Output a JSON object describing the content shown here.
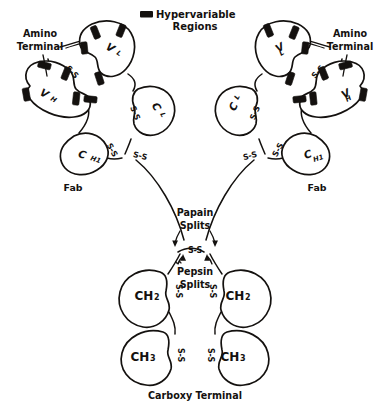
{
  "figure": {
    "background_color": "#ffffff",
    "ink_color": "#14110f",
    "width": 390,
    "height": 410
  },
  "legend": {
    "swatch_name": "hypervariable-region-swatch",
    "swatch_color": "#14110f",
    "line1": "Hypervariable",
    "line2": "Regions"
  },
  "annotations": {
    "amino_terminal_left_line1": "Amino",
    "amino_terminal_left_line2": "Terminal",
    "amino_terminal_right_line1": "Amino",
    "amino_terminal_right_line2": "Terminal",
    "papain_line1": "Papain",
    "papain_line2": "Splits",
    "pepsin_line1": "Pepsin",
    "pepsin_line2": "Splits",
    "carboxy_terminal": "Carboxy Terminal",
    "fab_left": "Fab",
    "fab_right": "Fab"
  },
  "domains": {
    "vl_left": "V",
    "vl_left_sub": "L",
    "vh_left": "V",
    "vh_left_sub": "H",
    "cl_left": "C",
    "cl_left_sub": "L",
    "ch1_left": "C",
    "ch1_left_sub": "H1",
    "vl_right": "V",
    "vl_right_sub": "L",
    "vh_right": "V",
    "vh_right_sub": "H",
    "cl_right": "C",
    "cl_right_sub": "L",
    "ch1_right": "C",
    "ch1_right_sub": "H1",
    "ch2_left": "CH",
    "ch2_left_sub": "2",
    "ch2_right": "CH",
    "ch2_right_sub": "2",
    "ch3_left": "CH",
    "ch3_left_sub": "3",
    "ch3_right": "CH",
    "ch3_right_sub": "3"
  },
  "disulfides": {
    "label": "S-S",
    "count_visible": 12,
    "locations": [
      "vl-vh-left",
      "cl-ch1-left",
      "hinge-left-outer",
      "vl-vh-right",
      "cl-ch1-right",
      "hinge-right-outer",
      "hinge-center",
      "ch2-left",
      "ch2-right",
      "ch3-left",
      "ch3-right"
    ]
  }
}
